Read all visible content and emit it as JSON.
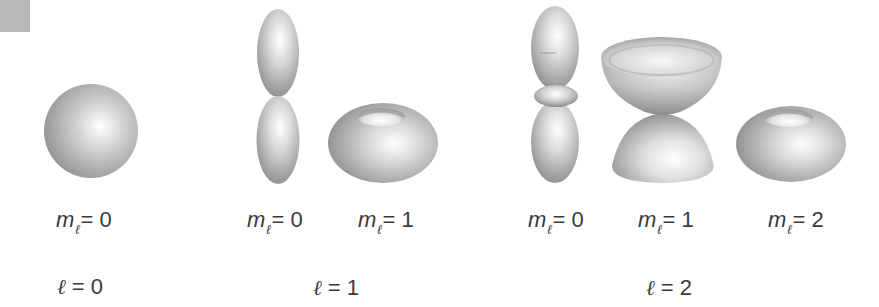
{
  "figure": {
    "groups": [
      {
        "l_label": {
          "symbol": "ℓ",
          "text": " = 0"
        },
        "orbitals": [
          {
            "shape": "sphere",
            "m_symbol": "m",
            "m_sub": "ℓ",
            "m_text": "= 0"
          }
        ]
      },
      {
        "l_label": {
          "symbol": "ℓ",
          "text": " = 1"
        },
        "orbitals": [
          {
            "shape": "dumbbell",
            "m_symbol": "m",
            "m_sub": "ℓ",
            "m_text": "= 0"
          },
          {
            "shape": "torus",
            "m_symbol": "m",
            "m_sub": "ℓ",
            "m_text": "= 1"
          }
        ]
      },
      {
        "l_label": {
          "symbol": "ℓ",
          "text": " = 2"
        },
        "orbitals": [
          {
            "shape": "dumbbell-with-ring",
            "m_symbol": "m",
            "m_sub": "ℓ",
            "m_text": "= 0"
          },
          {
            "shape": "double-cone",
            "m_symbol": "m",
            "m_sub": "ℓ",
            "m_text": "= 1"
          },
          {
            "shape": "torus",
            "m_symbol": "m",
            "m_sub": "ℓ",
            "m_text": "= 2"
          }
        ]
      }
    ],
    "colors": {
      "shade_dark": "#8a8a8a",
      "shade_mid": "#bdbdbd",
      "highlight": "#ffffff",
      "corner_square": "#b9b9b9",
      "text": "#3a3a3a"
    }
  }
}
